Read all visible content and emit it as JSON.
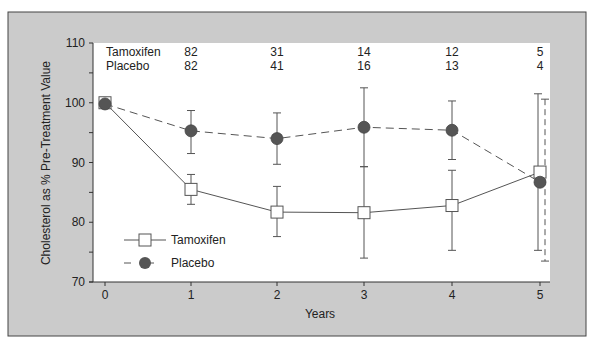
{
  "chart_data": {
    "type": "line",
    "title": "",
    "xlabel": "Years",
    "ylabel": "Cholesterol as % Pre-Treatment Value",
    "x": [
      0,
      1,
      2,
      3,
      4,
      5
    ],
    "xticks": [
      "0",
      "1",
      "2",
      "3",
      "4",
      "5"
    ],
    "yticks": [
      "70",
      "80",
      "90",
      "100",
      "110"
    ],
    "ylim": [
      70,
      110
    ],
    "xlim": [
      -0.15,
      5.05
    ],
    "grid": false,
    "legend_position": "lower-left",
    "series": [
      {
        "name": "Tamoxifen",
        "marker": "open-square",
        "line": "solid",
        "values": [
          100,
          85.5,
          81.7,
          81.6,
          82.8,
          88.4
        ],
        "err_upper": [
          100,
          88.0,
          86.0,
          89.3,
          88.7,
          101.5
        ],
        "err_lower": [
          100,
          83.0,
          77.6,
          74.0,
          75.3,
          75.3
        ]
      },
      {
        "name": "Placebo",
        "marker": "filled-circle",
        "line": "dashed",
        "values": [
          99.8,
          95.3,
          94.0,
          95.9,
          95.4,
          86.7
        ],
        "err_upper": [
          99.8,
          98.7,
          98.3,
          102.5,
          100.3,
          100.6
        ],
        "err_lower": [
          99.8,
          91.5,
          89.7,
          89.3,
          90.5,
          73.5
        ]
      }
    ],
    "n_table": {
      "rows": [
        {
          "label": "Tamoxifen",
          "counts": [
            "82",
            "31",
            "14",
            "12",
            "5"
          ]
        },
        {
          "label": "Placebo",
          "counts": [
            "82",
            "41",
            "16",
            "13",
            "4"
          ]
        }
      ],
      "years": [
        1,
        2,
        3,
        4,
        5
      ]
    }
  },
  "colors": {
    "frame_bg": "#cbcbcb",
    "plot_bg": "#ffffff",
    "axis": "#333333",
    "line": "#555555",
    "placebo_marker": "#555555",
    "tamoxifen_marker": "#ffffff"
  }
}
